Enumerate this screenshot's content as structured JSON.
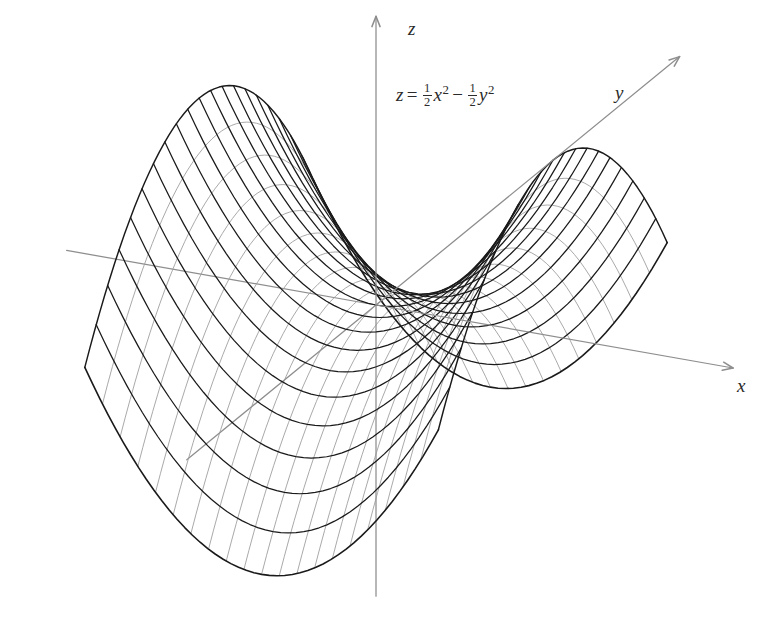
{
  "figure": {
    "kind": "3d-surface-wireframe",
    "title": "",
    "background_color": "#ffffff",
    "equation": {
      "lhs": "z",
      "relation": "=",
      "term1": {
        "coef_num": "1",
        "coef_den": "2",
        "var": "x",
        "power": "2"
      },
      "operator": "−",
      "term2": {
        "coef_num": "1",
        "coef_den": "2",
        "var": "y",
        "power": "2"
      },
      "plain": "z = 1/2 x^2 - 1/2 y^2"
    },
    "axes": [
      {
        "name": "z",
        "label": "z",
        "direction": "up",
        "label_x": 408,
        "label_y": 18
      },
      {
        "name": "y",
        "label": "y",
        "direction": "up-right",
        "label_x": 615,
        "label_y": 82
      },
      {
        "name": "x",
        "label": "x",
        "direction": "right",
        "label_x": 737,
        "label_y": 375
      }
    ],
    "colors": {
      "axis": "#8e8e8e",
      "mesh_major": "#1a1a1a",
      "mesh_minor": "#9a9a9a",
      "paper": "#ffffff"
    }
  },
  "chart_data": {
    "type": "line",
    "subtitle": "hyperbolic paraboloid (saddle surface) wireframe",
    "xlabel": "x",
    "ylabel": "y",
    "zlabel": "z",
    "surface": {
      "function": "z = 0.5*x^2 - 0.5*y^2",
      "coef_x2": 0.5,
      "coef_y2": -0.5,
      "xlim": [
        -2.6,
        2.6
      ],
      "ylim": [
        -2.6,
        2.6
      ],
      "zlim": [
        -3.4,
        3.4
      ],
      "saddle_point": [
        0,
        0,
        0
      ],
      "grid_lines_x": 21,
      "grid_lines_y": 21
    },
    "projection": {
      "type": "oblique-axonometric",
      "origin_px": [
        376,
        305
      ],
      "x_axis_px_per_unit": [
        68,
        12
      ],
      "y_axis_px_per_unit": [
        44,
        -36
      ],
      "z_axis_px_per_unit": [
        0,
        -52
      ]
    },
    "legend": [],
    "grid": false,
    "annotations": [
      {
        "text": "z = 1/2 x^2 - 1/2 y^2",
        "x_px": 396,
        "y_px": 82
      },
      {
        "text": "z",
        "x_px": 408,
        "y_px": 18
      },
      {
        "text": "y",
        "x_px": 615,
        "y_px": 82
      },
      {
        "text": "x",
        "x_px": 737,
        "y_px": 375
      }
    ]
  }
}
